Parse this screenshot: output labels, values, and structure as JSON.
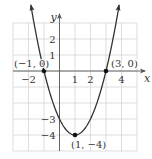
{
  "chart_data": {
    "type": "line",
    "title": "",
    "function": "y = (x - 1)^2 - 4",
    "xlabel": "x",
    "ylabel": "y",
    "xlim": [
      -3,
      5
    ],
    "ylim": [
      -5,
      3
    ],
    "grid": true,
    "x_ticks": [
      {
        "value": -2,
        "label": "−2"
      },
      {
        "value": 1,
        "label": "1"
      },
      {
        "value": 2,
        "label": "2"
      },
      {
        "value": 4,
        "label": "4"
      }
    ],
    "y_ticks": [
      {
        "value": 2,
        "label": "2"
      },
      {
        "value": 1,
        "label": "1"
      },
      {
        "value": -3,
        "label": "−3"
      },
      {
        "value": -4,
        "label": "−4"
      }
    ],
    "points": [
      {
        "x": -1,
        "y": 0,
        "label": "(−1, 0)"
      },
      {
        "x": 3,
        "y": 0,
        "label": "(3, 0)"
      },
      {
        "x": 1,
        "y": -4,
        "label": "(1, −4)"
      }
    ],
    "curve": {
      "x": [
        -1.85,
        -1.5,
        -1,
        -0.5,
        0,
        0.5,
        1,
        1.5,
        2,
        2.5,
        3,
        3.5,
        3.85
      ],
      "y": [
        4.12,
        2.25,
        0,
        -1.75,
        -3,
        -3.75,
        -4,
        -3.75,
        -3,
        -1.75,
        0,
        2.25,
        4.12
      ]
    }
  }
}
